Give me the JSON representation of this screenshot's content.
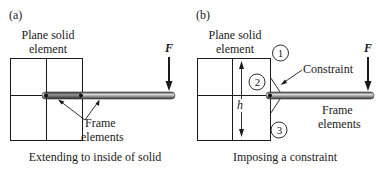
{
  "panel_a": {
    "tag": "(a)",
    "solid_label_line1": "Plane solid",
    "solid_label_line2": "element",
    "force_label": "F",
    "frame_label_line1": "Frame",
    "frame_label_line2": "elements",
    "caption": "Extending to inside of solid"
  },
  "panel_b": {
    "tag": "(b)",
    "solid_label_line1": "Plane solid",
    "solid_label_line2": "element",
    "force_label": "F",
    "node_1": "1",
    "node_2": "2",
    "node_3": "3",
    "constraint_label": "Constraint",
    "height_label": "h",
    "frame_label_line1": "Frame",
    "frame_label_line2": "elements",
    "caption": "Imposing a constraint"
  },
  "colors": {
    "line": "#1a1a1a",
    "rod_dark": "#555555",
    "rod_light": "#bdbdbd"
  }
}
